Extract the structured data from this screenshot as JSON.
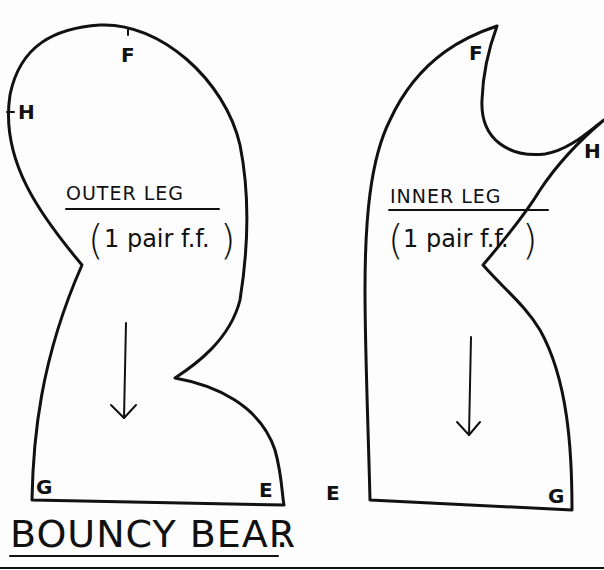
{
  "title": "BOUNCY BEAR",
  "title_suffix": ".",
  "pieces": [
    {
      "name": "OUTER LEG",
      "quantity": "1 pair f.f.",
      "points": [
        "F",
        "H",
        "G",
        "E"
      ],
      "grain_arrow": "down"
    },
    {
      "name": "INNER LEG",
      "quantity": "1 pair f.f.",
      "points": [
        "F",
        "H",
        "E",
        "G"
      ],
      "grain_arrow": "down"
    }
  ],
  "colors": {
    "ink": "#111111",
    "paper": "#fdfdfd"
  }
}
